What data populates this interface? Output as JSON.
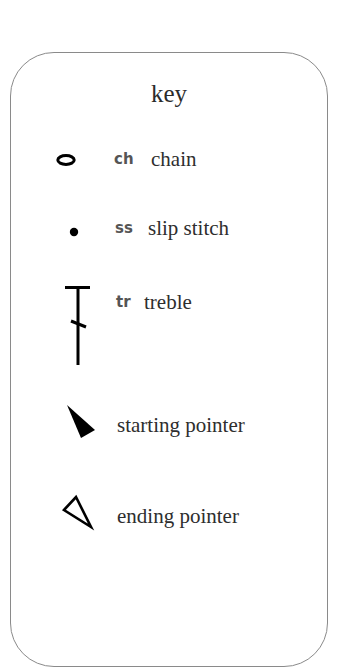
{
  "key": {
    "title": "key",
    "items": [
      {
        "symbol": "chain-oval-icon",
        "abbr": "ch",
        "label": "chain"
      },
      {
        "symbol": "slip-stitch-dot-icon",
        "abbr": "ss",
        "label": "slip stitch"
      },
      {
        "symbol": "treble-stitch-icon",
        "abbr": "tr",
        "label": "treble"
      },
      {
        "symbol": "filled-triangle-icon",
        "abbr": "",
        "label": "starting pointer"
      },
      {
        "symbol": "outline-triangle-icon",
        "abbr": "",
        "label": "ending pointer"
      }
    ]
  },
  "colors": {
    "border": "#8a8a8a",
    "text": "#2e2e2e",
    "abbr": "#555555",
    "symbol": "#000000"
  }
}
